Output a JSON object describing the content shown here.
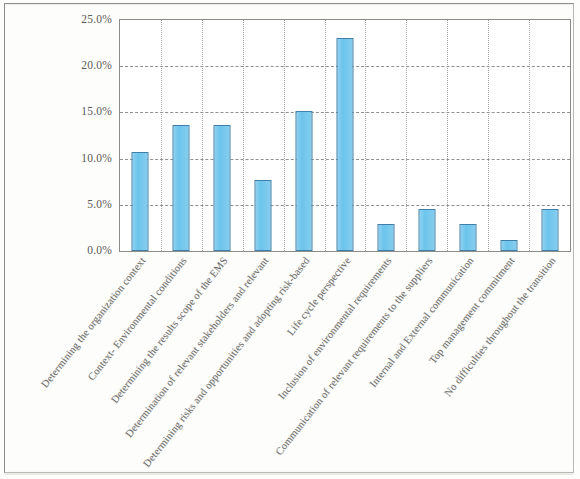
{
  "chart_data": {
    "type": "bar",
    "title": "",
    "subtitle": "",
    "xlabel": "",
    "ylabel": "",
    "ylim": [
      0,
      25
    ],
    "ytick_values": [
      0,
      5,
      10,
      15,
      20,
      25
    ],
    "ytick_labels": [
      "0.0%",
      "5.0%",
      "10.0%",
      "15.0%",
      "20.0%",
      "25.0%"
    ],
    "grid": true,
    "legend": "none",
    "value_suffix": "%",
    "categories": [
      "Determining the organization context",
      "Context- Environmental conditions",
      "Determining the results scope of the EMS",
      "Determination of relevant stakeholders and relevant",
      "Determining risks and opportunities and adopting risk-based",
      "Life cycle perspective",
      "Inclusion of environmental requirements",
      "Communication of relevant requirements to the suppliers",
      "Internal and External communication",
      "Top management commitment",
      "No difficulties throughout the transition"
    ],
    "values": [
      10.7,
      13.6,
      13.6,
      7.7,
      15.1,
      23.0,
      2.9,
      4.5,
      2.9,
      1.2,
      4.5
    ],
    "colors": {
      "bar_fill": "#6cc4ec",
      "bar_border": "#3f7fa8",
      "grid": "#7e7e7a",
      "axis": "#8d8d88",
      "text": "#5a5a57",
      "page_frame": "#b9b9b4",
      "background": "#ffffff"
    }
  }
}
